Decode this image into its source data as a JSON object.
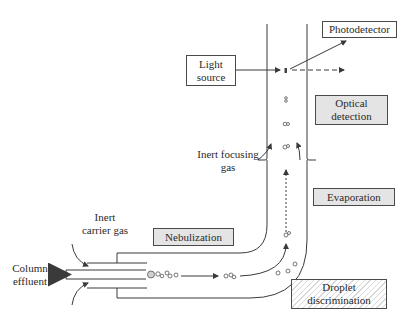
{
  "diagram": {
    "type": "schematic",
    "labels": {
      "column_effluent": "Column\neffluent",
      "inert_carrier_gas": "Inert\ncarrier gas",
      "inert_focusing_gas": "Inert focusing\ngas",
      "light_source": "Light\nsource",
      "photodetector": "Photodetector"
    },
    "stages": {
      "nebulization": "Nebulization",
      "evaporation": "Evaporation",
      "optical_detection": "Optical\ndetection",
      "droplet_discrimination": "Droplet\ndiscrimination"
    },
    "colors": {
      "line": "#3a3a3a",
      "stage_fill": "#e4e4e4",
      "hatch": "#d8d8d8",
      "background": "#ffffff"
    }
  }
}
